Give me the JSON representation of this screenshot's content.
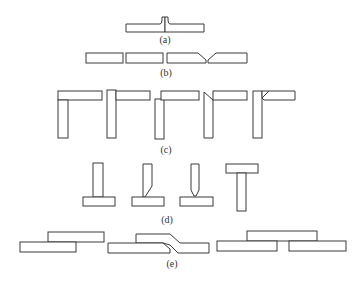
{
  "figure": {
    "labels": {
      "a": "(a)",
      "b": "(b)",
      "c": "(c)",
      "d": "(d)",
      "e": "(e)"
    },
    "groups": [
      {
        "id": "a",
        "name": "flanged butt joint",
        "count": 1
      },
      {
        "id": "b",
        "name": "butt joints (square and V-groove)",
        "count": 2
      },
      {
        "id": "c",
        "name": "corner joints",
        "count": 5
      },
      {
        "id": "d",
        "name": "T-joints",
        "count": 4
      },
      {
        "id": "e",
        "name": "lap joints",
        "count": 3
      }
    ],
    "colors": {
      "stroke": "#3a3a3a",
      "background": "#ffffff",
      "text": "#333333"
    }
  }
}
